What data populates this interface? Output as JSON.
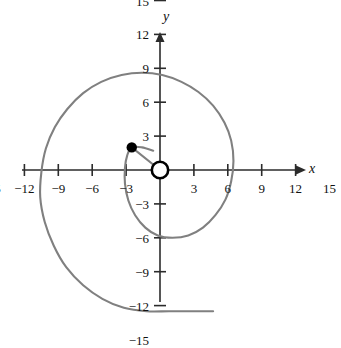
{
  "figure": {
    "background_color": "#ffffff",
    "curve_color": "#808080",
    "axis_color": "#2b2b2b",
    "marker_color": "#000000",
    "x_axis_label": "x",
    "y_axis_label": "y"
  },
  "axes": {
    "x_tick_labels": [
      "−15",
      "−12",
      "−9",
      "−6",
      "−3",
      "3",
      "6",
      "9",
      "12",
      "15"
    ],
    "x_tick_values": [
      -15,
      -12,
      -9,
      -6,
      -3,
      3,
      6,
      9,
      12,
      15
    ],
    "y_tick_labels": [
      "15",
      "12",
      "9",
      "6",
      "3",
      "−3",
      "−6",
      "−9",
      "−12",
      "−15"
    ],
    "y_tick_values": [
      15,
      12,
      9,
      6,
      3,
      -3,
      -6,
      -9,
      -12,
      -15
    ],
    "x_range": [
      -17,
      17
    ],
    "y_range": [
      -17,
      17
    ],
    "origin_px": [
      160,
      170
    ],
    "scale_px_per_unit": 11.3
  },
  "chart_data": {
    "type": "line",
    "title": "",
    "xlabel": "x",
    "ylabel": "y",
    "xlim": [
      -17,
      17
    ],
    "ylim": [
      -17,
      17
    ],
    "grid": false,
    "legend": null,
    "series": [
      {
        "name": "spiral",
        "description": "Archimedean spiral unwinding clockwise from near the origin outward, ending in a short horizontal tail near y = -12.5",
        "color": "#808080",
        "points": [
          [
            -0.6,
            1.7
          ],
          [
            -1.6,
            2.0
          ],
          [
            -2.5,
            2.0
          ],
          [
            -2.9,
            1.3
          ],
          [
            -3.1,
            0.2
          ],
          [
            -3.1,
            -1.2
          ],
          [
            -2.8,
            -2.7
          ],
          [
            -2.2,
            -4.0
          ],
          [
            -1.3,
            -5.1
          ],
          [
            -0.2,
            -5.8
          ],
          [
            1.1,
            -6.0
          ],
          [
            2.5,
            -5.8
          ],
          [
            3.8,
            -5.1
          ],
          [
            4.9,
            -4.0
          ],
          [
            5.8,
            -2.6
          ],
          [
            6.3,
            -1.0
          ],
          [
            6.5,
            0.8
          ],
          [
            6.3,
            2.6
          ],
          [
            5.7,
            4.2
          ],
          [
            4.7,
            5.7
          ],
          [
            3.4,
            6.9
          ],
          [
            1.9,
            7.8
          ],
          [
            0.2,
            8.4
          ],
          [
            -1.6,
            8.6
          ],
          [
            -3.4,
            8.4
          ],
          [
            -5.2,
            7.8
          ],
          [
            -6.8,
            6.8
          ],
          [
            -8.2,
            5.4
          ],
          [
            -9.3,
            3.8
          ],
          [
            -10.1,
            1.9
          ],
          [
            -10.5,
            -0.2
          ],
          [
            -10.6,
            -2.4
          ],
          [
            -10.2,
            -4.6
          ],
          [
            -9.4,
            -6.7
          ],
          [
            -8.3,
            -8.6
          ],
          [
            -6.8,
            -10.2
          ],
          [
            -5.1,
            -11.4
          ],
          [
            -3.2,
            -12.2
          ],
          [
            -1.2,
            -12.5
          ],
          [
            0.8,
            -12.5
          ],
          [
            2.8,
            -12.5
          ],
          [
            4.7,
            -12.5
          ]
        ]
      },
      {
        "name": "radius-segment",
        "description": "Straight segment from the origin to the marked point",
        "color": "#808080",
        "points": [
          [
            0,
            0
          ],
          [
            -2.5,
            2.0
          ]
        ]
      }
    ],
    "markers": [
      {
        "name": "open-point",
        "style": "open-circle",
        "x": 0,
        "y": 0,
        "color": "#000000",
        "label": ""
      },
      {
        "name": "closed-point",
        "style": "filled-circle",
        "x": -2.5,
        "y": 2.0,
        "color": "#000000",
        "label": ""
      }
    ]
  }
}
